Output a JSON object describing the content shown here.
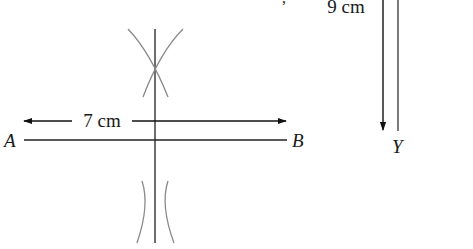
{
  "diagram": {
    "type": "geometric-construction",
    "colors": {
      "ink": "#1a1a1a",
      "construction_line": "#4a4a4a",
      "arc": "#8a8a8a",
      "background": "#ffffff"
    },
    "segment_ab": {
      "point_start_label": "A",
      "point_end_label": "B",
      "length_label": "7 cm"
    },
    "segment_xy": {
      "point_end_label": "Y",
      "length_label": "9 cm"
    },
    "perpendicular_bisector": {
      "arc_pairs": 2
    },
    "stray_mark": ","
  }
}
